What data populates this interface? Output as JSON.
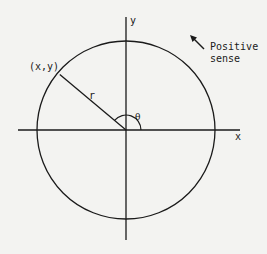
{
  "diagram": {
    "labels": {
      "x_axis": "x",
      "y_axis": "y",
      "point": "(x,y)",
      "radius": "r",
      "angle": "θ",
      "direction_line1": "Positive",
      "direction_line2": "sense"
    },
    "geometry": {
      "center": [
        126,
        130
      ],
      "circle_radius": 89,
      "angle_arc_radius": 15,
      "point_angle_deg": 140
    },
    "colors": {
      "stroke": "#1a1a1a",
      "background": "#f3f3f1"
    }
  }
}
